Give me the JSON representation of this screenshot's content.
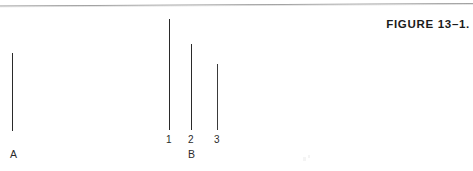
{
  "page": {
    "background_color": "#ffffff",
    "width": 473,
    "height": 171
  },
  "rule": {
    "name": "top-horizontal-rule",
    "color": "#9a9a9a",
    "left_y": 6,
    "right_y": 3.5
  },
  "caption": {
    "text": "FIGURE 13–1.",
    "color": "#1b1b1b"
  },
  "chart_data": {
    "type": "bar",
    "orientation": "vertical-lines",
    "title": "FIGURE 13–1.",
    "xlabel": "",
    "ylabel": "",
    "grid": false,
    "legend": null,
    "note": "Line-length comparison stimulus: standard line A versus comparison lines 1, 2, 3 of group B.",
    "groups": [
      {
        "name": "A",
        "label": "A",
        "label_x": 10,
        "label_y": 149,
        "lines": [
          {
            "id": "A",
            "label": "",
            "x": 12,
            "top": 53,
            "bottom": 131,
            "length": 78,
            "color": "#2a2a2a"
          }
        ]
      },
      {
        "name": "B",
        "label": "B",
        "label_x": 188,
        "label_y": 149,
        "lines": [
          {
            "id": "1",
            "label": "1",
            "x": 169,
            "top": 19,
            "bottom": 130,
            "length": 111,
            "color": "#2a2a2a",
            "label_x": 166,
            "label_y": 134
          },
          {
            "id": "2",
            "label": "2",
            "x": 191,
            "top": 44,
            "bottom": 130,
            "length": 86,
            "color": "#2a2a2a",
            "label_x": 188,
            "label_y": 134
          },
          {
            "id": "3",
            "label": "3",
            "x": 217,
            "top": 64,
            "bottom": 130,
            "length": 66,
            "color": "#3a3a3a",
            "label_x": 214,
            "label_y": 134
          }
        ]
      }
    ],
    "categories": [
      "A",
      "1",
      "2",
      "3"
    ],
    "values": [
      78,
      111,
      86,
      66
    ]
  }
}
